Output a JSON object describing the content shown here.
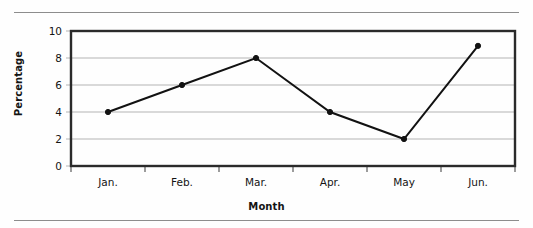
{
  "figure": {
    "background_color": "#fefefe",
    "rule_color": "#8d8d8d"
  },
  "chart_data": {
    "type": "line",
    "title": "",
    "xlabel": "Month",
    "ylabel": "Percentage",
    "categories": [
      "Jan.",
      "Feb.",
      "Mar.",
      "Apr.",
      "May",
      "Jun."
    ],
    "values": [
      4,
      6,
      8,
      4,
      2,
      8.9
    ],
    "series": [
      {
        "name": "Percentage",
        "values": [
          4,
          6,
          8,
          4,
          2,
          8.9
        ]
      }
    ],
    "ylim": [
      0,
      10
    ],
    "yticks": [
      0,
      2,
      4,
      6,
      8,
      10
    ],
    "ytick_labels": [
      "0",
      "2",
      "4",
      "6",
      "8",
      "10"
    ],
    "grid": "horizontal",
    "legend": "none",
    "line_color": "#121212",
    "marker": "circle",
    "marker_color": "#121212",
    "gridline_color": "#b4b4b4",
    "frame_color": "#2a2a2a"
  }
}
